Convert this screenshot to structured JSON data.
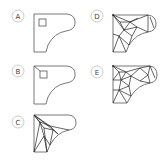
{
  "figure": {
    "panels": [
      {
        "label": "A",
        "description": "Outline with square hole"
      },
      {
        "label": "B",
        "description": "Outline with hole connected to corner"
      },
      {
        "label": "C",
        "description": "Triangulated mesh, coarse"
      },
      {
        "label": "D",
        "description": "Triangulated mesh, refined"
      },
      {
        "label": "E",
        "description": "Triangulated mesh, further refined"
      }
    ],
    "colors": {
      "outline": "#555555",
      "mesh": "#222222",
      "label_circle": "#aaaaaa",
      "background": "#ffffff"
    }
  }
}
